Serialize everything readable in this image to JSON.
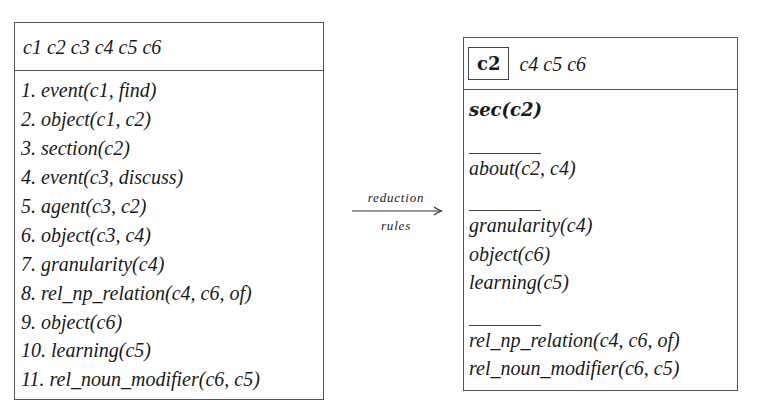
{
  "left_box": {
    "header": "c1 c2 c3 c4 c5 c6",
    "items": [
      "1. event(c1, find)",
      "2. object(c1, c2)",
      "3. section(c2)",
      "4. event(c3, discuss)",
      "5. agent(c3, c2)",
      "6. object(c3, c4)",
      "7. granularity(c4)",
      "8. rel_np_relation(c4, c6, of)",
      "9. object(c6)",
      "10. learning(c5)",
      "11. rel_noun_modifier(c6, c5)"
    ]
  },
  "arrow": {
    "top_label": "reduction",
    "bottom_label": "rules"
  },
  "right_box": {
    "header_focus": "c2",
    "header_rest": "c4 c5 c6",
    "groups": {
      "g1": [
        "sec(c2)"
      ],
      "g2": [
        "about(c2, c4)"
      ],
      "g3": [
        "granularity(c4)",
        "object(c6)",
        "learning(c5)"
      ],
      "g4": [
        "rel_np_relation(c4, c6, of)",
        "rel_noun_modifier(c6, c5)"
      ]
    }
  }
}
